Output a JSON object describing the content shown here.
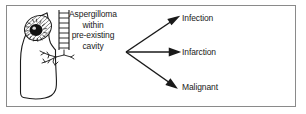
{
  "figure": {
    "kind": "medical-flow-diagram",
    "border_color": "#8a8a8a",
    "ink_color": "#1a1a1a",
    "background": "#ffffff"
  },
  "illustration": {
    "name": "lung-with-aspergilloma-cavity",
    "parts": [
      "lung-outline",
      "apical-cavity",
      "fungus-ball",
      "trachea-with-cartilage-rings",
      "bronchial-tree"
    ]
  },
  "source": {
    "lines": [
      "Aspergilloma",
      "within",
      "pre-existing",
      "cavity"
    ],
    "text": "Aspergilloma within pre-existing cavity"
  },
  "outcomes": [
    {
      "label": "Infection",
      "arrow": "up-right"
    },
    {
      "label": "Infarction",
      "arrow": "right"
    },
    {
      "label": "Malignant",
      "arrow": "down-right"
    }
  ]
}
